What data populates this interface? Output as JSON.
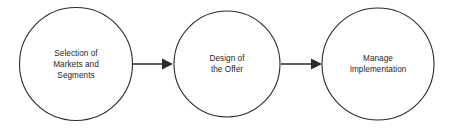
{
  "diagram": {
    "type": "process-flow",
    "title": "",
    "background_color": "#ffffff",
    "stroke_color": "#2b2b2b",
    "text_color": "#262626",
    "nodes": [
      {
        "id": "selection-of-markets-and-segments",
        "shape": "circle",
        "cx": 76,
        "cy": 64,
        "r": 57,
        "lines": [
          "Selection of",
          "Markets and",
          "Segments"
        ],
        "text": "Selection of Markets and Segments"
      },
      {
        "id": "design-of-the-offer",
        "shape": "circle",
        "cx": 227,
        "cy": 64,
        "r": 53,
        "lines": [
          "Design of",
          "the Offer"
        ],
        "text": "Design of the Offer"
      },
      {
        "id": "manage-implementation",
        "shape": "circle",
        "cx": 378,
        "cy": 64,
        "r": 56,
        "lines": [
          "Manage",
          "Implementation"
        ],
        "text": "Manage Implementation"
      }
    ],
    "connectors": [
      {
        "id": "arrow-1",
        "from": "selection-of-markets-and-segments",
        "to": "design-of-the-offer",
        "direction": "right",
        "x1": 133,
        "x2": 173,
        "y": 64,
        "label": ""
      },
      {
        "id": "arrow-2",
        "from": "design-of-the-offer",
        "to": "manage-implementation",
        "direction": "right",
        "x1": 281,
        "x2": 322,
        "y": 64,
        "label": ""
      }
    ]
  }
}
